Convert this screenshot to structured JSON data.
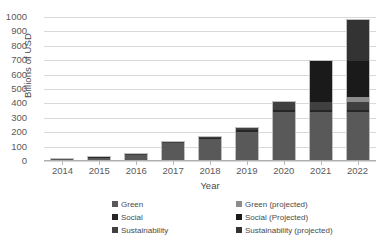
{
  "chart_data": {
    "type": "bar",
    "stacked": true,
    "title": "",
    "xlabel": "Year",
    "ylabel": "Billions of USD",
    "ylim": [
      0,
      1000
    ],
    "ytick_step": 100,
    "yticks": [
      0,
      100,
      200,
      300,
      400,
      500,
      600,
      700,
      800,
      900,
      1000
    ],
    "grid": true,
    "legend_position": "bottom",
    "categories": [
      "2014",
      "2015",
      "2016",
      "2017",
      "2018",
      "2019",
      "2020",
      "2021",
      "2022"
    ],
    "series": [
      {
        "name": "Green",
        "color": "#595959",
        "values": [
          9,
          17,
          33,
          115,
          145,
          195,
          330,
          330,
          330
        ]
      },
      {
        "name": "Social",
        "color": "#262626",
        "values": [
          1,
          2,
          4,
          5,
          8,
          14,
          20,
          20,
          20
        ]
      },
      {
        "name": "Sustainability",
        "color": "#404040",
        "values": [
          0,
          1,
          3,
          5,
          10,
          15,
          50,
          50,
          50
        ]
      },
      {
        "name": "Green (projected)",
        "color": "#8c8c8c",
        "values": [
          0,
          0,
          0,
          0,
          0,
          0,
          0,
          0,
          40
        ]
      },
      {
        "name": "Social (Projected)",
        "color": "#1a1a1a",
        "values": [
          0,
          0,
          0,
          0,
          0,
          0,
          0,
          290,
          250
        ]
      },
      {
        "name": "Sustainability (projected)",
        "color": "#333333",
        "values": [
          0,
          0,
          0,
          0,
          0,
          0,
          0,
          0,
          280
        ]
      }
    ],
    "totals": [
      10,
      20,
      40,
      125,
      163,
      224,
      400,
      690,
      970
    ],
    "legend": [
      {
        "label": "Green",
        "color": "#595959"
      },
      {
        "label": "Social",
        "color": "#262626"
      },
      {
        "label": "Sustainability",
        "color": "#404040"
      },
      {
        "label": "Green (projected)",
        "color": "#8c8c8c"
      },
      {
        "label": "Social (Projected)",
        "color": "#1a1a1a"
      },
      {
        "label": "Sustainability (projected)",
        "color": "#333333"
      }
    ]
  }
}
